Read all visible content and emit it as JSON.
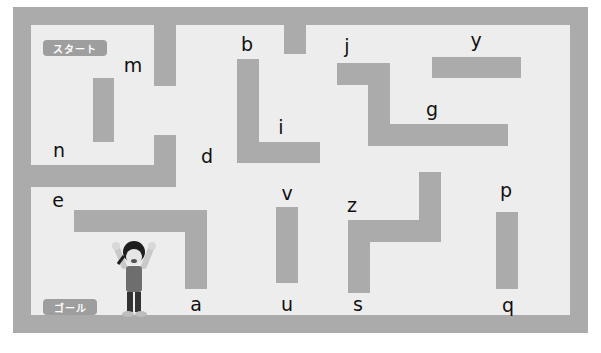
{
  "maze": {
    "wall_color": "#ababab",
    "floor_color": "#ededed",
    "start_label": "スタート",
    "goal_label": "ゴール",
    "character": "girl-cheering-icon",
    "letters": [
      {
        "id": "m",
        "text": "m",
        "x": 133,
        "y": 65
      },
      {
        "id": "n",
        "text": "n",
        "x": 59,
        "y": 150
      },
      {
        "id": "b",
        "text": "b",
        "x": 247,
        "y": 44
      },
      {
        "id": "i",
        "text": "i",
        "x": 281,
        "y": 127
      },
      {
        "id": "d",
        "text": "d",
        "x": 207,
        "y": 156
      },
      {
        "id": "j",
        "text": "j",
        "x": 347,
        "y": 46
      },
      {
        "id": "y",
        "text": "y",
        "x": 476,
        "y": 40
      },
      {
        "id": "g",
        "text": "g",
        "x": 432,
        "y": 109
      },
      {
        "id": "e",
        "text": "e",
        "x": 58,
        "y": 200
      },
      {
        "id": "v",
        "text": "v",
        "x": 287,
        "y": 193
      },
      {
        "id": "z",
        "text": "z",
        "x": 352,
        "y": 205
      },
      {
        "id": "p",
        "text": "p",
        "x": 506,
        "y": 190
      },
      {
        "id": "a",
        "text": "a",
        "x": 196,
        "y": 304
      },
      {
        "id": "u",
        "text": "u",
        "x": 287,
        "y": 304
      },
      {
        "id": "s",
        "text": "s",
        "x": 358,
        "y": 304
      },
      {
        "id": "q",
        "text": "q",
        "x": 508,
        "y": 305
      }
    ]
  }
}
